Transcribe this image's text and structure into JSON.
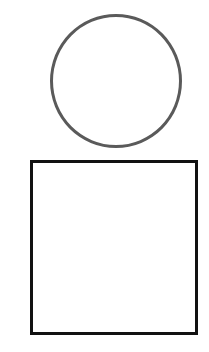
{
  "diagram": {
    "shapes": [
      {
        "type": "circle",
        "stroke_color": "#5a5a5a",
        "fill_color": "#ffffff",
        "stroke_width": 3
      },
      {
        "type": "square",
        "stroke_color": "#111111",
        "fill_color": "#ffffff",
        "stroke_width": 3
      }
    ],
    "background_color": "#ffffff"
  }
}
